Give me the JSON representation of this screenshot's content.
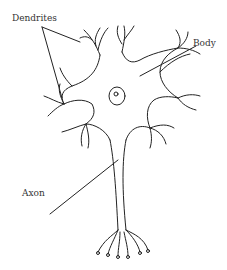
{
  "diagram": {
    "labels": {
      "dendrites": "Dendrites",
      "body": "Body",
      "axon": "Axon"
    },
    "colors": {
      "stroke": "#222222",
      "text": "#333333",
      "background": "#ffffff"
    }
  }
}
